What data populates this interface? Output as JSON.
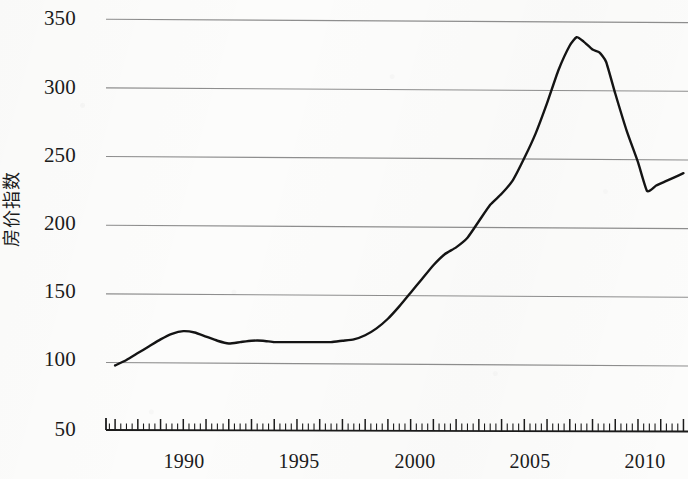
{
  "chart_data": {
    "type": "line",
    "title": "",
    "subtitle": "",
    "xlabel": "",
    "ylabel": "房价指数",
    "ylabel_translation": "House Price Index",
    "xlim": [
      1986.6,
      2012.2
    ],
    "ylim": [
      50,
      350
    ],
    "y_ticks": [
      50,
      100,
      150,
      200,
      250,
      300,
      350
    ],
    "x_ticks": [
      1990,
      1995,
      2000,
      2005,
      2010
    ],
    "x_tick_labels": [
      "1990",
      "1995",
      "2000",
      "2005",
      "2010"
    ],
    "y_tick_labels": [
      "50",
      "100",
      "150",
      "200",
      "250",
      "300",
      "350"
    ],
    "grid": "horizontal",
    "minor_ticks": "quarterly",
    "legend": null,
    "line_color": "#141414",
    "grid_color": "#8e8e8e",
    "axis_color": "#1b1b1b",
    "series": [
      {
        "name": "房价指数",
        "x": [
          1987.0,
          1987.5,
          1988.0,
          1988.5,
          1989.0,
          1989.5,
          1990.0,
          1990.5,
          1991.0,
          1991.5,
          1992.0,
          1992.5,
          1993.0,
          1993.5,
          1994.0,
          1994.5,
          1995.0,
          1995.5,
          1996.0,
          1996.5,
          1997.0,
          1997.5,
          1998.0,
          1998.5,
          1999.0,
          1999.5,
          2000.0,
          2000.5,
          2001.0,
          2001.5,
          2002.0,
          2002.5,
          2003.0,
          2003.5,
          2004.0,
          2004.5,
          2005.0,
          2005.5,
          2006.0,
          2006.5,
          2007.0,
          2007.3,
          2007.6,
          2008.0,
          2008.3,
          2008.6,
          2009.0,
          2009.5,
          2010.0,
          2010.4,
          2010.8,
          2011.2,
          2011.6,
          2012.0
        ],
        "y": [
          97,
          101,
          106,
          111,
          116,
          120,
          122,
          121,
          118,
          115,
          113,
          114,
          115,
          115,
          114,
          114,
          114,
          114,
          114,
          114,
          115,
          116,
          119,
          124,
          131,
          140,
          150,
          160,
          170,
          178,
          183,
          190,
          202,
          214,
          222,
          232,
          248,
          266,
          288,
          312,
          330,
          336,
          333,
          327,
          325,
          318,
          295,
          268,
          245,
          224,
          228,
          231,
          234,
          237
        ]
      }
    ],
    "annotations": [],
    "notable_points": {
      "start_value": 97,
      "early_peak_year": 1990,
      "early_peak_value": 122,
      "trough_1992_1997_value": 114,
      "peak_year": 2007.3,
      "peak_value": 336,
      "post_crash_trough_year": 2010.4,
      "post_crash_trough_value": 224,
      "end_value": 237
    }
  },
  "axis": {
    "y_title": "房价指数"
  }
}
